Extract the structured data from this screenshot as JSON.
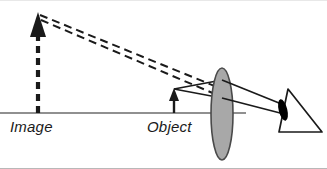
{
  "figure": {
    "kind": "optics-ray-diagram",
    "width": 327,
    "height": 169,
    "background": "#ffffff"
  },
  "colors": {
    "stroke": "#1a1a1a",
    "axis": "#6b6b6b",
    "lens_fill": "#a8a8a8",
    "lens_stroke": "#4a4a4a",
    "eye_pupil": "#000000",
    "label_text": "#1a1a1a",
    "border": "#b8b8b8"
  },
  "labels": {
    "image": "Image",
    "object": "Object"
  },
  "optical_axis": {
    "y": 112,
    "x_start": 0,
    "x_end": 246,
    "stroke_width": 1.6
  },
  "image_arrow": {
    "x": 38,
    "base_y": 112,
    "tip_y": 12,
    "style": "dashed",
    "dash": "7 5",
    "stroke_width": 4,
    "head_width": 16,
    "head_height": 22,
    "label": "Image",
    "label_x": 10,
    "label_y": 130
  },
  "object_arrow": {
    "x": 174,
    "base_y": 112,
    "tip_y": 88,
    "style": "solid",
    "stroke_width": 2.4,
    "head_width": 9,
    "head_height": 12,
    "label": "Object",
    "label_x": 147,
    "label_y": 130
  },
  "lens": {
    "center_x": 222,
    "center_y": 113,
    "rx": 11,
    "ry": 46,
    "fill": "#a8a8a8",
    "stroke": "#4a4a4a",
    "stroke_width": 1.6
  },
  "virtual_rays": [
    {
      "name": "upper-virtual-ray",
      "x1": 40,
      "y1": 14,
      "x2": 216,
      "y2": 86,
      "dash": "8 5",
      "stroke_width": 2
    },
    {
      "name": "lower-virtual-ray",
      "x1": 40,
      "y1": 18,
      "x2": 214,
      "y2": 92,
      "dash": "8 5",
      "stroke_width": 2
    }
  ],
  "object_rays": [
    {
      "name": "upper-object-ray",
      "x1": 174,
      "y1": 88,
      "x2": 221,
      "y2": 80,
      "stroke_width": 1.6
    },
    {
      "name": "lower-object-ray",
      "x1": 174,
      "y1": 88,
      "x2": 221,
      "y2": 96,
      "stroke_width": 1.6
    }
  ],
  "refracted_rays": [
    {
      "name": "upper-refracted-ray",
      "x1": 221,
      "y1": 80,
      "x2": 283,
      "y2": 105,
      "stroke_width": 1.6
    },
    {
      "name": "lower-refracted-ray",
      "x1": 221,
      "y1": 96,
      "x2": 283,
      "y2": 112,
      "stroke_width": 1.6
    }
  ],
  "eye": {
    "apex_x": 288,
    "apex_y": 88,
    "back_x": 322,
    "back_y": 131,
    "base_x": 279,
    "base_y": 131,
    "pupil_cx": 283,
    "pupil_cy": 108,
    "pupil_rx": 4.2,
    "pupil_ry": 11,
    "pupil_rotate": -16,
    "stroke_width": 1.6
  }
}
